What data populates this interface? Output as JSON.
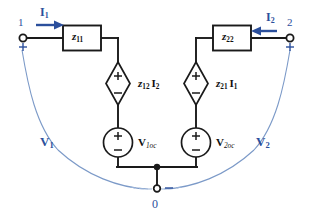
{
  "diagram": {
    "colors": {
      "wire": "#1a1a1a",
      "label_blue": "#2b4f9c",
      "arc_blue": "#6f8fc4",
      "background": "#ffffff"
    },
    "terminals": [
      {
        "name": "terminal-1",
        "label": "1",
        "polarity": "+"
      },
      {
        "name": "terminal-2",
        "label": "2",
        "polarity": "+"
      },
      {
        "name": "terminal-ground",
        "label": "0",
        "polarity": "−"
      }
    ],
    "currents": [
      {
        "name": "current-i1",
        "label": "I",
        "subscript": "1",
        "direction": "right"
      },
      {
        "name": "current-i2",
        "label": "I",
        "subscript": "2",
        "direction": "left"
      }
    ],
    "impedances": [
      {
        "name": "impedance-z11",
        "label": "z",
        "subscript": "11"
      },
      {
        "name": "impedance-z22",
        "label": "z",
        "subscript": "22"
      }
    ],
    "dependent_sources": [
      {
        "name": "dependent-source-z12i2",
        "label": "z",
        "subscript": "12",
        "current": "I",
        "current_subscript": "2",
        "plus": "+",
        "minus": "−"
      },
      {
        "name": "dependent-source-z21i1",
        "label": "z",
        "subscript": "21",
        "current": "I",
        "current_subscript": "1",
        "plus": "+",
        "minus": "−"
      }
    ],
    "independent_sources": [
      {
        "name": "voltage-source-v1oc",
        "label": "V",
        "subscript": "1oc",
        "plus": "+",
        "minus": "−"
      },
      {
        "name": "voltage-source-v2oc",
        "label": "V",
        "subscript": "2oc",
        "plus": "+",
        "minus": "−"
      }
    ],
    "port_voltages": [
      {
        "name": "port-voltage-v1",
        "label": "V",
        "subscript": "1"
      },
      {
        "name": "port-voltage-v2",
        "label": "V",
        "subscript": "2"
      }
    ]
  }
}
